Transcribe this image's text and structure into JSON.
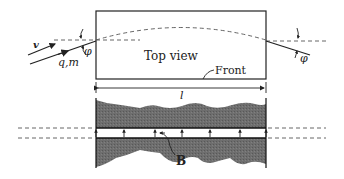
{
  "diagram": {
    "top_view": {
      "label": "Top view",
      "front_label": "Front",
      "box": {
        "x": 96,
        "y": 11,
        "w": 170,
        "h": 68
      }
    },
    "particle": {
      "velocity_label": "v",
      "charge_mass_label": "q,m",
      "angle_in_label": "φ",
      "angle_out_label": "φ"
    },
    "length_label": "l",
    "field_label": "B",
    "colors": {
      "line": "#222222",
      "dashed": "#555555",
      "pole": "#6f6f6f"
    }
  }
}
